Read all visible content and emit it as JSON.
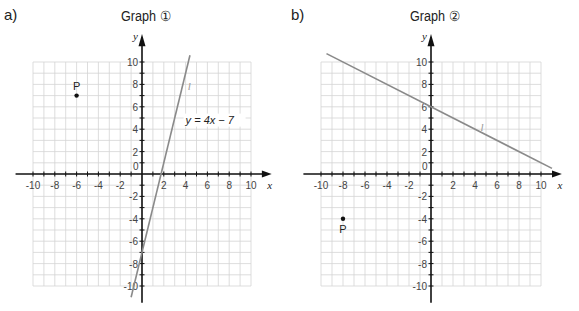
{
  "parts": [
    {
      "label": "a)",
      "title": "Graph ①"
    },
    {
      "label": "b)",
      "title": "Graph ②"
    }
  ],
  "chart_data": [
    {
      "type": "line",
      "title": "Graph ①",
      "xlabel": "x",
      "ylabel": "y",
      "xlim": [
        -10,
        10
      ],
      "ylim": [
        -10,
        10
      ],
      "grid": true,
      "x_ticks": [
        -10,
        -8,
        -6,
        -4,
        -2,
        0,
        2,
        4,
        6,
        8,
        10
      ],
      "y_ticks": [
        -10,
        -8,
        -6,
        -4,
        -2,
        2,
        4,
        6,
        8,
        10
      ],
      "series": [
        {
          "name": "l",
          "equation": "y = 4x − 7",
          "x": [
            -1,
            4.4
          ],
          "y": [
            -11,
            10.6
          ]
        }
      ],
      "points": [
        {
          "label": "P",
          "x": -6,
          "y": 7
        }
      ],
      "annotations": [
        "y = 4x − 7",
        "l"
      ]
    },
    {
      "type": "line",
      "title": "Graph ②",
      "xlabel": "x",
      "ylabel": "y",
      "xlim": [
        -10,
        10
      ],
      "ylim": [
        -10,
        10
      ],
      "grid": true,
      "x_ticks": [
        -10,
        -8,
        -6,
        -4,
        -2,
        0,
        2,
        4,
        6,
        8,
        10
      ],
      "y_ticks": [
        -10,
        -8,
        -6,
        -4,
        -2,
        2,
        4,
        6,
        8,
        10
      ],
      "series": [
        {
          "name": "l",
          "x": [
            -9.5,
            11
          ],
          "y": [
            10.75,
            0.5
          ]
        }
      ],
      "points": [
        {
          "label": "P",
          "x": -8,
          "y": -4
        }
      ],
      "annotations": [
        "l"
      ]
    }
  ]
}
